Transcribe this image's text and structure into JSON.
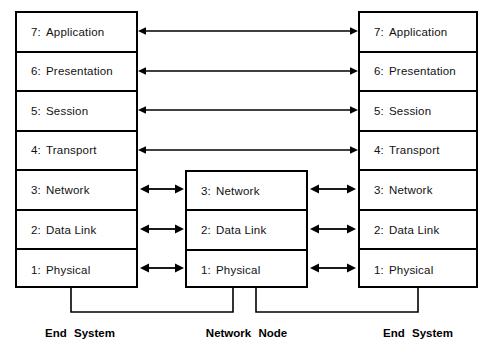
{
  "diagram": {
    "line_color": "#000000",
    "background_color": "#ffffff"
  },
  "end_system_left": {
    "caption": "End System",
    "layers": [
      {
        "number": "7:",
        "name": "Application"
      },
      {
        "number": "6:",
        "name": "Presentation"
      },
      {
        "number": "5:",
        "name": "Session"
      },
      {
        "number": "4:",
        "name": "Transport"
      },
      {
        "number": "3:",
        "name": "Network"
      },
      {
        "number": "2:",
        "name": "Data  Link"
      },
      {
        "number": "1:",
        "name": "Physical"
      }
    ]
  },
  "network_node": {
    "caption": "Network  Node",
    "layers": [
      {
        "number": "3:",
        "name": "Network"
      },
      {
        "number": "2:",
        "name": "Data  Link"
      },
      {
        "number": "1:",
        "name": "Physical"
      }
    ]
  },
  "end_system_right": {
    "caption": "End System",
    "layers": [
      {
        "number": "7:",
        "name": "Application"
      },
      {
        "number": "6:",
        "name": "Presentation"
      },
      {
        "number": "5:",
        "name": "Session"
      },
      {
        "number": "4:",
        "name": "Transport"
      },
      {
        "number": "3:",
        "name": "Network"
      },
      {
        "number": "2:",
        "name": "Data  Link"
      },
      {
        "number": "1:",
        "name": "Physical"
      }
    ]
  },
  "connections": {
    "end_to_end_peer_arrows": [
      {
        "layer": "7: Application",
        "from": "end_system_left",
        "to": "end_system_right",
        "style": "double-headed"
      },
      {
        "layer": "6: Presentation",
        "from": "end_system_left",
        "to": "end_system_right",
        "style": "double-headed"
      },
      {
        "layer": "5: Session",
        "from": "end_system_left",
        "to": "end_system_right",
        "style": "double-headed"
      },
      {
        "layer": "4: Transport",
        "from": "end_system_left",
        "to": "end_system_right",
        "style": "double-headed"
      }
    ],
    "left_to_node_arrows": [
      {
        "layer": "3: Network",
        "style": "double-headed"
      },
      {
        "layer": "2: Data Link",
        "style": "double-headed"
      },
      {
        "layer": "1: Physical",
        "style": "double-headed"
      }
    ],
    "node_to_right_arrows": [
      {
        "layer": "3: Network",
        "style": "double-headed"
      },
      {
        "layer": "2: Data Link",
        "style": "double-headed"
      },
      {
        "layer": "1: Physical",
        "style": "double-headed"
      }
    ],
    "physical_media_links": [
      {
        "from": "end_system_left",
        "to": "network_node",
        "style": "u-shaped-line"
      },
      {
        "from": "network_node",
        "to": "end_system_right",
        "style": "u-shaped-line"
      }
    ]
  }
}
